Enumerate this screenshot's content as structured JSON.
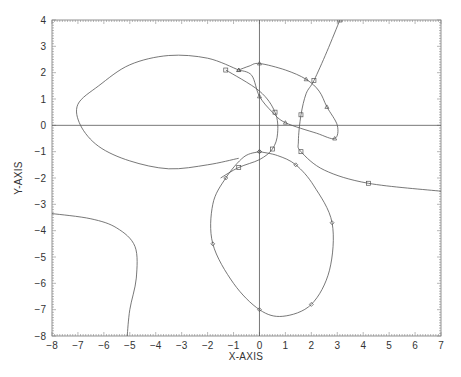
{
  "chart_data": {
    "type": "line",
    "title": "",
    "xlabel": "X-AXIS",
    "ylabel": "Y-AXIS",
    "xlim": [
      -8,
      7
    ],
    "ylim": [
      -8,
      4
    ],
    "grid": false,
    "legend": null,
    "x_ticks": [
      "-8",
      "-7",
      "-6",
      "-5",
      "-4",
      "-3",
      "-2",
      "-1",
      "0",
      "1",
      "2",
      "3",
      "4",
      "5",
      "6",
      "7"
    ],
    "y_ticks": [
      "4",
      "3",
      "2",
      "1",
      "0",
      "-1",
      "-2",
      "-3",
      "-4",
      "-5",
      "-6",
      "-7",
      "-8"
    ],
    "reference_lines": [
      {
        "orientation": "horizontal",
        "value": 0
      },
      {
        "orientation": "vertical",
        "value": 0
      }
    ],
    "series": [
      {
        "name": "left-ellipse",
        "marker": "none",
        "points": [
          [
            -0.8,
            2.1
          ],
          [
            -2,
            2.55
          ],
          [
            -3.5,
            2.65
          ],
          [
            -5,
            2.3
          ],
          [
            -6.2,
            1.5
          ],
          [
            -7,
            0.8
          ],
          [
            -6.9,
            0
          ],
          [
            -6.2,
            -0.8
          ],
          [
            -5,
            -1.35
          ],
          [
            -3.5,
            -1.65
          ],
          [
            -2,
            -1.5
          ],
          [
            -0.8,
            -1.25
          ]
        ]
      },
      {
        "name": "tilted-ellipse",
        "marker": "triangle",
        "points": [
          [
            -0.8,
            2.1
          ],
          [
            -0.4,
            2.25
          ],
          [
            0,
            2.35
          ],
          [
            1,
            2.1
          ],
          [
            1.8,
            1.75
          ],
          [
            2.3,
            1.3
          ],
          [
            2.6,
            0.7
          ],
          [
            3,
            0
          ],
          [
            2.9,
            -0.5
          ],
          [
            2.2,
            -0.3
          ],
          [
            1,
            0.1
          ],
          [
            0.5,
            0.5
          ],
          [
            0,
            1.1
          ],
          [
            -0.3,
            1.9
          ],
          [
            -0.8,
            2.1
          ]
        ]
      },
      {
        "name": "lower-ellipse",
        "marker": "diamond",
        "points": [
          [
            0,
            -1.0
          ],
          [
            0.7,
            -1.15
          ],
          [
            1.4,
            -1.5
          ],
          [
            2.1,
            -2.3
          ],
          [
            2.8,
            -3.7
          ],
          [
            2.7,
            -5.5
          ],
          [
            2,
            -6.8
          ],
          [
            0.9,
            -7.25
          ],
          [
            0,
            -7
          ],
          [
            -1,
            -6
          ],
          [
            -1.8,
            -4.5
          ],
          [
            -1.8,
            -3
          ],
          [
            -1.3,
            -2
          ],
          [
            -0.6,
            -1.2
          ],
          [
            0,
            -1.0
          ]
        ]
      },
      {
        "name": "upper-branch",
        "marker": "square",
        "points": [
          [
            -1.3,
            2.1
          ],
          [
            0,
            1.3
          ],
          [
            0.6,
            0.5
          ],
          [
            0.7,
            -0.3
          ],
          [
            0.5,
            -0.9
          ],
          [
            0,
            -1.3
          ],
          [
            -0.8,
            -1.6
          ],
          [
            -1.5,
            -2.0
          ]
        ]
      },
      {
        "name": "right-curve",
        "marker": "square",
        "points": [
          [
            3.1,
            4
          ],
          [
            2.6,
            2.8
          ],
          [
            2.1,
            1.7
          ],
          [
            1.8,
            1.2
          ],
          [
            1.6,
            0.4
          ],
          [
            1.5,
            -0.6
          ],
          [
            1.6,
            -1.0
          ],
          [
            2.5,
            -1.7
          ],
          [
            4.2,
            -2.2
          ],
          [
            7,
            -2.5
          ]
        ]
      },
      {
        "name": "bottom-left-curve",
        "marker": "none",
        "points": [
          [
            -8,
            -3.35
          ],
          [
            -6.5,
            -3.55
          ],
          [
            -5.5,
            -3.9
          ],
          [
            -4.8,
            -4.6
          ],
          [
            -4.75,
            -5.8
          ],
          [
            -5,
            -7.0
          ],
          [
            -5.1,
            -8
          ]
        ]
      }
    ]
  }
}
